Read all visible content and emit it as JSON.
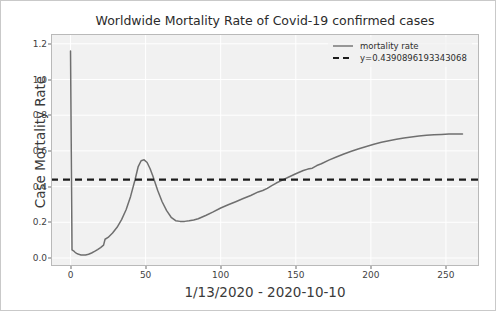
{
  "chart_data": {
    "type": "line",
    "title": "Worldwide Mortality Rate of Covid-19 confirmed cases",
    "xlabel": "1/13/2020 - 2020-10-10",
    "ylabel": "Case Mortality Rate",
    "xlim": [
      -13,
      272
    ],
    "ylim": [
      -0.045,
      1.255
    ],
    "xticks": [
      0,
      50,
      100,
      150,
      200,
      250
    ],
    "xtick_labels": [
      "0",
      "50",
      "100",
      "150",
      "200",
      "250"
    ],
    "yticks": [
      0.0,
      0.2,
      0.4,
      0.6,
      0.8,
      1.0,
      1.2
    ],
    "ytick_labels": [
      "0.0",
      "0.2",
      "0.4",
      "0.6",
      "0.8",
      "1.0",
      "1.2"
    ],
    "grid": true,
    "legend_position": "upper right",
    "series": [
      {
        "name": "mortality rate",
        "style": "solid",
        "color": "#6f6f6f",
        "x": [
          0,
          1,
          2,
          3,
          4,
          5,
          6,
          7,
          8,
          9,
          10,
          12,
          14,
          16,
          18,
          20,
          22,
          23,
          25,
          28,
          31,
          34,
          37,
          40,
          43,
          45,
          47,
          49,
          51,
          53,
          55,
          58,
          61,
          64,
          67,
          70,
          73,
          76,
          79,
          82,
          85,
          90,
          95,
          100,
          105,
          110,
          115,
          120,
          125,
          128,
          131,
          134,
          137,
          140,
          145,
          150,
          155,
          158,
          161,
          164,
          167,
          172,
          177,
          182,
          187,
          192,
          197,
          202,
          207,
          212,
          217,
          222,
          227,
          232,
          237,
          242,
          247,
          252,
          257,
          261
        ],
        "y": [
          1.16,
          0.045,
          0.04,
          0.032,
          0.026,
          0.022,
          0.019,
          0.017,
          0.016,
          0.016,
          0.017,
          0.021,
          0.028,
          0.037,
          0.047,
          0.058,
          0.072,
          0.105,
          0.115,
          0.14,
          0.172,
          0.215,
          0.27,
          0.345,
          0.44,
          0.51,
          0.545,
          0.55,
          0.535,
          0.5,
          0.455,
          0.38,
          0.315,
          0.265,
          0.228,
          0.209,
          0.205,
          0.205,
          0.208,
          0.213,
          0.22,
          0.238,
          0.258,
          0.28,
          0.298,
          0.315,
          0.333,
          0.35,
          0.37,
          0.378,
          0.39,
          0.405,
          0.42,
          0.432,
          0.452,
          0.472,
          0.49,
          0.498,
          0.503,
          0.518,
          0.528,
          0.548,
          0.566,
          0.583,
          0.598,
          0.612,
          0.625,
          0.637,
          0.648,
          0.657,
          0.665,
          0.672,
          0.678,
          0.683,
          0.687,
          0.69,
          0.692,
          0.694,
          0.695,
          0.695
        ]
      }
    ],
    "hline": {
      "name": "y=0.4390896193343068",
      "value": 0.4390896193343068,
      "style": "dashed",
      "color": "#1c1c1c"
    }
  },
  "legend": {
    "entries": [
      {
        "label": "mortality rate",
        "style": "solid"
      },
      {
        "label": "y=0.4390896193343068",
        "style": "dashed"
      }
    ]
  },
  "colors": {
    "line": "#6f6f6f",
    "hline": "#1c1c1c",
    "plot_background": "#f1f1f1",
    "grid": "#ffffff",
    "axis_text": "#3f3f3f",
    "card_border": "#c9c9c9"
  }
}
